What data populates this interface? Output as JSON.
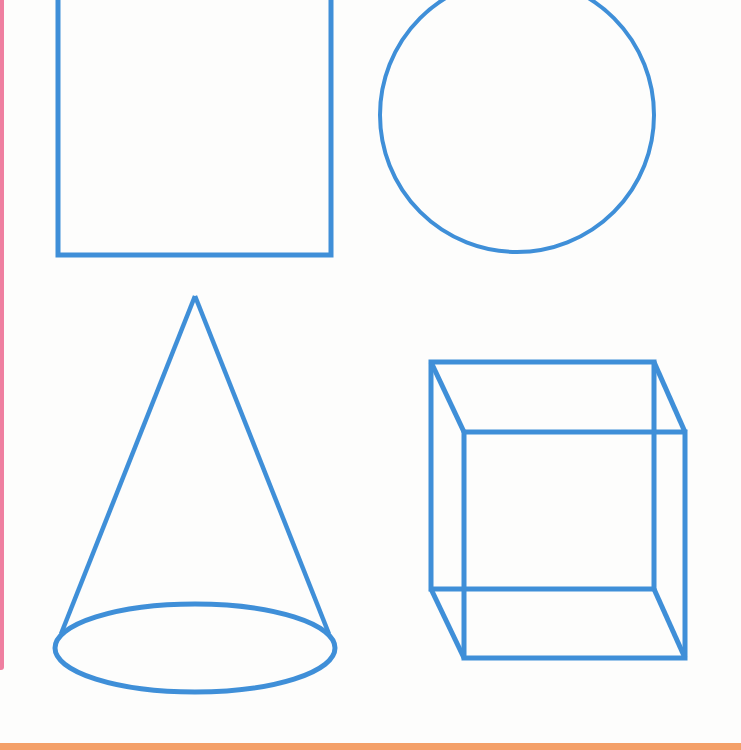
{
  "page": {
    "title": "Geometric shapes: square, circle, cone, cube",
    "colors": {
      "stroke": "#3f8fd8",
      "background": "#fdfdfc",
      "left_strip": "#ef7fa0",
      "bottom_band": "#f4a069"
    }
  },
  "shapes": [
    {
      "name": "square",
      "type": "rectangle",
      "x": 58,
      "y": -4,
      "width": 273,
      "height": 259
    },
    {
      "name": "circle",
      "type": "circle",
      "cx": 517,
      "cy": 115,
      "r": 137
    },
    {
      "name": "cone",
      "type": "cone",
      "apex": [
        195,
        296
      ],
      "base_center": [
        195,
        648
      ],
      "base_rx": 140,
      "base_ry": 44
    },
    {
      "name": "cube",
      "type": "cube",
      "back_face": {
        "x": 431,
        "y": 362,
        "width": 223,
        "height": 227
      },
      "front_face": {
        "x": 464,
        "y": 432,
        "width": 221,
        "height": 226
      }
    }
  ],
  "diagram": {
    "labels": []
  }
}
